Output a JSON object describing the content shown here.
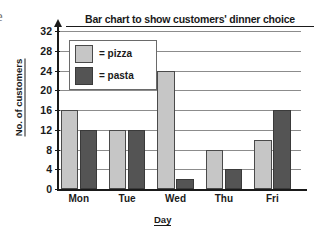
{
  "page": {
    "edge_fragment": "e"
  },
  "chart_data": {
    "type": "bar",
    "title": "Bar chart to show customers' dinner choice",
    "xlabel": "Day",
    "ylabel": "No. of customers",
    "categories": [
      "Mon",
      "Tue",
      "Wed",
      "Thu",
      "Fri"
    ],
    "series": [
      {
        "name": "pizza",
        "color": "#c6c6c6",
        "values": [
          16,
          12,
          24,
          8,
          10
        ]
      },
      {
        "name": "pasta",
        "color": "#545454",
        "values": [
          12,
          12,
          2,
          4,
          16
        ]
      }
    ],
    "ylim": [
      0,
      32
    ],
    "ytick_labels": [
      "32",
      "28",
      "24",
      "20",
      "16",
      "12",
      "8",
      "4",
      "0"
    ],
    "ytick_values": [
      32,
      28,
      24,
      20,
      16,
      12,
      8,
      4,
      0
    ],
    "grid": true,
    "legend_position": "inside-top-left",
    "legend": [
      {
        "label": "= pizza",
        "series": "pizza"
      },
      {
        "label": "= pasta",
        "series": "pasta"
      }
    ]
  }
}
